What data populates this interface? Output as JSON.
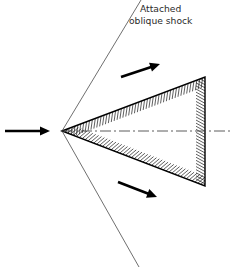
{
  "figure": {
    "background_color": "#ffffff",
    "width": 230,
    "height": 267
  },
  "labels": {
    "shock_label_line1": "Attached",
    "shock_label_line2": "oblique shock",
    "shock_label_color": "#2b2b2b",
    "shock_label_font_size": 9.2,
    "shock_label_line1_x": 140,
    "shock_label_line1_y": 12,
    "shock_label_line2_x": 129,
    "shock_label_line2_y": 24
  },
  "geometry": {
    "apex": {
      "x": 62,
      "y": 131
    },
    "wedge_top_vertex": {
      "x": 205,
      "y": 77
    },
    "wedge_bottom_vertex": {
      "x": 205,
      "y": 186
    },
    "wedge_outline_color": "#000000",
    "wedge_outline_width": 1.4,
    "wedge_fill": "#ffffff",
    "hatch_color": "#1a1a1a",
    "hatch_band_width": 9,
    "hatch_spacing": 3.1,
    "hatch_stroke_width": 0.7
  },
  "shock_waves": {
    "color": "#4a4a4a",
    "stroke_width": 0.8,
    "upper": {
      "x1": 62,
      "y1": 131,
      "x2": 141,
      "y2": 0
    },
    "lower": {
      "x1": 62,
      "y1": 131,
      "x2": 139,
      "y2": 267
    }
  },
  "centerline": {
    "color": "#4a4a4a",
    "stroke_width": 0.9,
    "dash_pattern": "11 3 2 3",
    "x1": 62,
    "y1": 131,
    "x2": 230,
    "y2": 131
  },
  "arrows": {
    "color": "#000000",
    "shaft_width": 2.6,
    "freestream": {
      "name": "freestream-flow-arrow",
      "x1": 5,
      "y1": 131,
      "x2": 50,
      "y2": 131,
      "head_length": 10,
      "head_half_width": 4.6
    },
    "upper_deflected": {
      "name": "upper-deflected-flow-arrow",
      "x1": 121,
      "y1": 77,
      "x2": 160,
      "y2": 64,
      "head_length": 10,
      "head_half_width": 4.6
    },
    "lower_deflected": {
      "name": "lower-deflected-flow-arrow",
      "x1": 118,
      "y1": 182,
      "x2": 157,
      "y2": 197,
      "head_length": 10,
      "head_half_width": 4.6
    }
  }
}
